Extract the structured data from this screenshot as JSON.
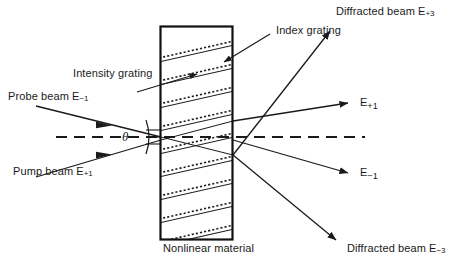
{
  "figure": {
    "type": "optics-diagram",
    "background_color": "#ffffff",
    "ink_color": "#1a1a1a"
  },
  "material": {
    "label": "Nonlinear material",
    "rect": {
      "x": 160,
      "y": 26,
      "width": 73,
      "height": 214
    },
    "border_color": "#111111",
    "border_width": 2
  },
  "gratings": {
    "intensity_label": "Intensity grating",
    "index_label": "Index grating",
    "solid_line_count": 9,
    "dotted_line_count": 9,
    "solid_color": "#1a1a1a",
    "dotted_color": "#1a1a1a"
  },
  "angle": {
    "symbol": "θ",
    "description": "half-angle between pump and probe beams"
  },
  "axis": {
    "style": "dashed",
    "description": "optical axis reference line"
  },
  "beams": {
    "incoming": [
      {
        "name": "probe-beam",
        "label": "Probe beam E",
        "subscript": "−1"
      },
      {
        "name": "pump-beam",
        "label": "Pump beam E",
        "subscript": "+1"
      }
    ],
    "outgoing": [
      {
        "name": "diffracted-beam-plus-3",
        "label": "Diffracted beam E",
        "subscript": "+3"
      },
      {
        "name": "beam-plus-1",
        "label": "E",
        "subscript": "+1"
      },
      {
        "name": "beam-minus-1",
        "label": "E",
        "subscript": "−1"
      },
      {
        "name": "diffracted-beam-minus-3",
        "label": "Diffracted beam E",
        "subscript": "−3"
      }
    ]
  },
  "caption": {
    "text": ""
  }
}
